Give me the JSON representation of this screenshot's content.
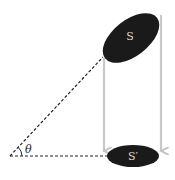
{
  "diagram": {
    "top_shape": {
      "label": "S",
      "fill": "#1a1a1a",
      "label_color": "#d8d8d8"
    },
    "bottom_shape": {
      "label": "S′",
      "fill": "#1a1a1a",
      "label_color": "#d8d8d8"
    },
    "angle": {
      "label": "θ"
    },
    "projection_arrows": {
      "color": "#c8c8c8",
      "count": 2
    },
    "dashed_lines": {
      "color": "#222222",
      "count": 2
    }
  }
}
